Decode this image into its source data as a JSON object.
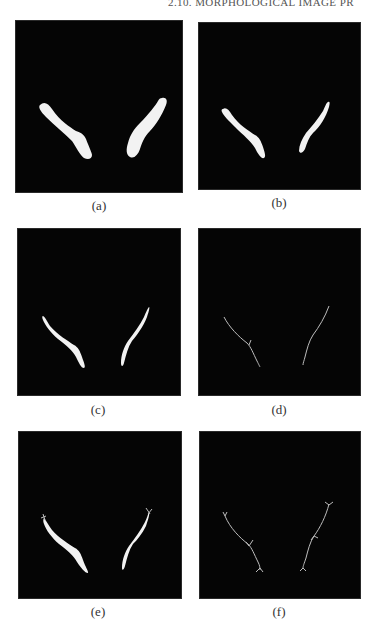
{
  "page": {
    "running_head": "2.10. MORPHOLOGICAL IMAGE PR"
  },
  "figure": {
    "background_color": "#050505",
    "foreground_color": "#f2f2f2",
    "panels": [
      {
        "id": "a",
        "caption": "(a)",
        "content": "binary object (filled shapes)"
      },
      {
        "id": "b",
        "caption": "(b)",
        "content": "eroded object"
      },
      {
        "id": "c",
        "caption": "(c)",
        "content": "further thinned object"
      },
      {
        "id": "d",
        "caption": "(d)",
        "content": "skeleton"
      },
      {
        "id": "e",
        "caption": "(e)",
        "content": "thinned object with spurs"
      },
      {
        "id": "f",
        "caption": "(f)",
        "content": "skeleton with branches"
      }
    ]
  }
}
